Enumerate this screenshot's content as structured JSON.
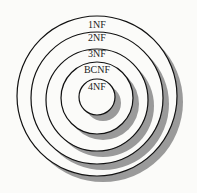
{
  "diagram": {
    "type": "nested-circles",
    "levels": [
      {
        "label": "1NF",
        "cx": 97,
        "cy": 96,
        "r": 80,
        "label_y": 28
      },
      {
        "label": "2NF",
        "cx": 97,
        "cy": 98,
        "r": 66,
        "label_y": 41
      },
      {
        "label": "3NF",
        "cx": 97,
        "cy": 100,
        "r": 51,
        "label_y": 57
      },
      {
        "label": "BCNF",
        "cx": 97,
        "cy": 98,
        "r": 36,
        "label_y": 73
      },
      {
        "label": "4NF",
        "cx": 97,
        "cy": 97,
        "r": 18,
        "label_y": 90
      }
    ],
    "colors": {
      "stroke": "#111111",
      "fill": "#fbfbf9",
      "shadow": "#9a9a9a"
    },
    "shadow_offset": {
      "dx": 6,
      "dy": 6
    }
  }
}
